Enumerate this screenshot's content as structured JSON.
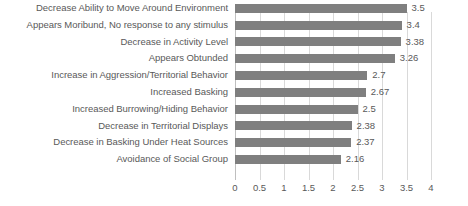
{
  "chart_data": {
    "type": "bar",
    "orientation": "horizontal",
    "title": "",
    "xlabel": "",
    "ylabel": "",
    "xlim": [
      0,
      4
    ],
    "xticks": [
      "0",
      "0.5",
      "1",
      "1.5",
      "2",
      "2.5",
      "3",
      "3.5",
      "4"
    ],
    "xtick_values": [
      0,
      0.5,
      1,
      1.5,
      2,
      2.5,
      3,
      3.5,
      4
    ],
    "grid": true,
    "legend": false,
    "categories": [
      "Decrease Ability to Move Around Environment",
      "Appears Moribund, No response to any stimulus",
      "Decrease in Activity Level",
      "Appears Obtunded",
      "Increase in Aggression/Territorial Behavior",
      "Increased Basking",
      "Increased Burrowing/Hiding Behavior",
      "Decrease in Territorial Displays",
      "Decrease in Basking Under Heat Sources",
      "Avoidance of Social Group"
    ],
    "values": [
      3.5,
      3.4,
      3.38,
      3.26,
      2.7,
      2.67,
      2.5,
      2.38,
      2.37,
      2.16
    ],
    "value_labels": [
      "3.5",
      "3.4",
      "3.38",
      "3.26",
      "2.7",
      "2.67",
      "2.5",
      "2.38",
      "2.37",
      "2.16"
    ],
    "colors": {
      "bar": "#7f7f7f",
      "text": "#595959",
      "gridline": "#d9d9d9",
      "axis": "#bfbfbf",
      "background": "#ffffff"
    }
  }
}
